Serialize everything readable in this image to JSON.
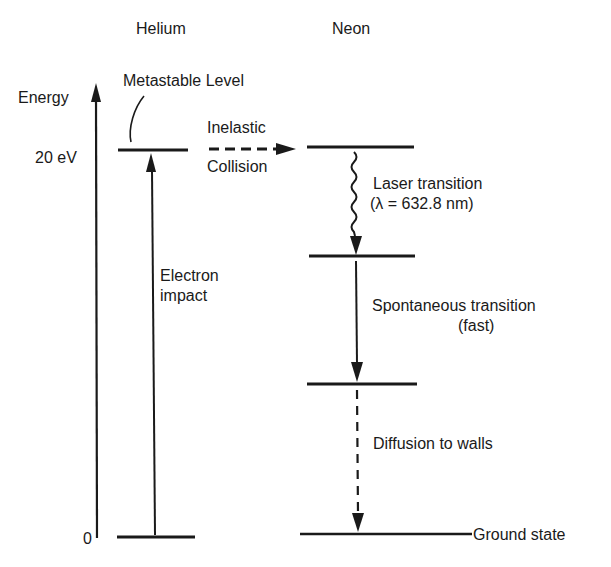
{
  "diagram": {
    "type": "energy-level-diagram",
    "columns": {
      "helium": "Helium",
      "neon": "Neon"
    },
    "axis": {
      "label": "Energy",
      "tick_top": "20 eV",
      "tick_bottom": "0"
    },
    "helium_levels": [
      {
        "name": "metastable",
        "label": "Metastable Level",
        "energy": "20 eV"
      },
      {
        "name": "ground",
        "energy": "0"
      }
    ],
    "neon_levels": [
      {
        "name": "upper-laser-level"
      },
      {
        "name": "lower-laser-level"
      },
      {
        "name": "intermediate-level"
      },
      {
        "name": "ground",
        "label": "Ground state"
      }
    ],
    "transitions": {
      "electron_impact": {
        "line1": "Electron",
        "line2": "impact",
        "style": "solid-up"
      },
      "inelastic_collision": {
        "line1": "Inelastic",
        "line2": "Collision",
        "style": "dashed-right"
      },
      "laser": {
        "line1": "Laser transition",
        "line2": "(λ = 632.8 nm)",
        "style": "wavy-down"
      },
      "spontaneous": {
        "line1": "Spontaneous transition",
        "line2": "(fast)",
        "style": "solid-down"
      },
      "diffusion": {
        "line1": "Diffusion to walls",
        "style": "dashed-down"
      }
    },
    "colors": {
      "ink": "#1a1a1a",
      "background": "#ffffff"
    }
  }
}
